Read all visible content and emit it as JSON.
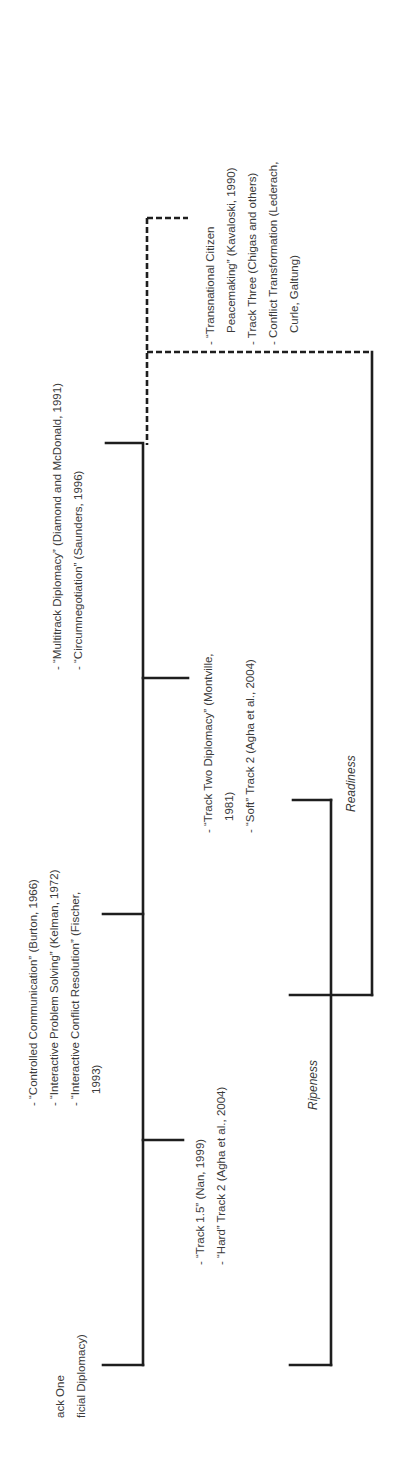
{
  "figure": {
    "orientation": "rotated -90deg (text reads bottom-to-top)",
    "track_one": {
      "lines": [
        "ack One",
        "ficial Diplomacy)"
      ]
    },
    "controlled_communication": {
      "lines": [
        "- “Controlled Communication” (Burton, 1966)",
        "- “Interactive Problem Solving” (Kelman, 1972)",
        "- “Interactive Conflict Resolution” (Fischer,",
        "1993)"
      ]
    },
    "multitrack": {
      "lines": [
        "- “Multitrack Diplomacy” (Diamond and McDonald, 1991)",
        "- “Circumnegotiation” (Saunders, 1996)"
      ]
    },
    "track_one_five": {
      "lines": [
        "- “Track 1.5” (Nan, 1999)",
        "- “Hard” Track 2 (Agha et al., 2004)"
      ]
    },
    "track_two": {
      "lines": [
        "- “Track Two Diplomacy” (Montville,",
        "1981)",
        "- “Soft” Track 2 (Agha et al., 2004)"
      ]
    },
    "transnational": {
      "lines": [
        "- “Transnational Citizen",
        "Peacemaking” (Kavaloski, 1990)",
        "- Track Three (Chigas and others)",
        "- Conflict Transformation (Lederach,",
        "Curle, Galtung)"
      ]
    },
    "ripeness_label": "Ripeness",
    "readiness_label": "Readiness"
  },
  "colors": {
    "line": "#1e1e1e",
    "text": "#3a3a3a",
    "background": "#ffffff"
  }
}
